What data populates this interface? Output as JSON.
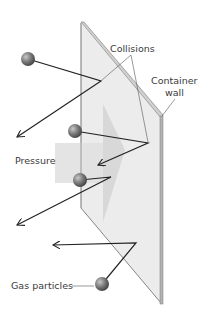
{
  "labels": {
    "collisions": "Collisions",
    "container_wall_line1": "Container",
    "container_wall_line2": "wall",
    "pressure": "Pressure",
    "gas_particles": "Gas particles"
  },
  "colors": {
    "wall_fill": "#ececec",
    "wall_edge": "#a9a9a9",
    "pressure_arrow": "#d9d9d9",
    "particle": "#7a7a7a",
    "path": "#222222",
    "label": "#3a3a3a"
  },
  "particles": [
    {
      "id": "particle-1",
      "cx": 28,
      "cy": 59
    },
    {
      "id": "particle-2",
      "cx": 75,
      "cy": 131
    },
    {
      "id": "particle-3",
      "cx": 80,
      "cy": 180
    },
    {
      "id": "particle-4",
      "cx": 102,
      "cy": 284
    }
  ]
}
